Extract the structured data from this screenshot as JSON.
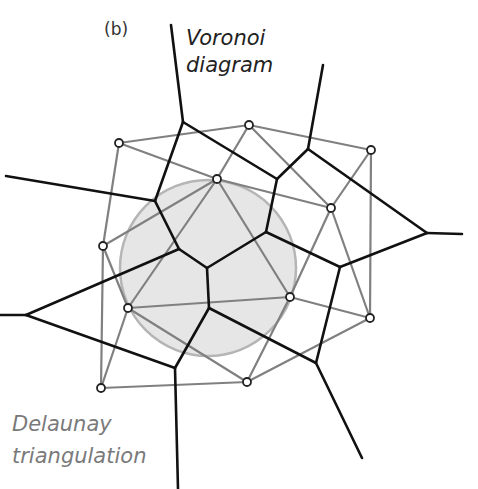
{
  "labels": {
    "panel": "(b)",
    "voronoi_line1": "Voronoi",
    "voronoi_line2": "diagram",
    "delaunay_line1": "Delaunay",
    "delaunay_line2": "triangulation"
  },
  "colors": {
    "voronoi_edge": "#111111",
    "delaunay_edge": "#808080",
    "circle_fill": "#e6e6e6",
    "circle_stroke": "#b5b5b5",
    "point_fill": "#ffffff",
    "point_stroke": "#222222"
  },
  "circumcircle": {
    "cx": 208,
    "cy": 268,
    "r": 88
  },
  "points": [
    [
      119,
      143
    ],
    [
      249,
      125
    ],
    [
      371,
      150
    ],
    [
      217,
      179
    ],
    [
      331,
      208
    ],
    [
      103,
      246
    ],
    [
      128,
      308
    ],
    [
      290,
      297
    ],
    [
      370,
      318
    ],
    [
      101,
      388
    ],
    [
      247,
      382
    ]
  ],
  "delaunay_edges": [
    [
      0,
      1
    ],
    [
      1,
      2
    ],
    [
      0,
      5
    ],
    [
      0,
      3
    ],
    [
      1,
      3
    ],
    [
      1,
      4
    ],
    [
      2,
      4
    ],
    [
      2,
      8
    ],
    [
      3,
      5
    ],
    [
      3,
      6
    ],
    [
      3,
      7
    ],
    [
      3,
      4
    ],
    [
      5,
      6
    ],
    [
      5,
      9
    ],
    [
      6,
      7
    ],
    [
      6,
      9
    ],
    [
      6,
      10
    ],
    [
      7,
      4
    ],
    [
      7,
      8
    ],
    [
      7,
      10
    ],
    [
      4,
      8
    ],
    [
      9,
      10
    ],
    [
      10,
      8
    ]
  ],
  "voronoi_edges": [
    [
      [
        171,
        25
      ],
      [
        183,
        122
      ]
    ],
    [
      [
        183,
        122
      ],
      [
        155,
        201
      ]
    ],
    [
      [
        183,
        122
      ],
      [
        277,
        179
      ]
    ],
    [
      [
        308,
        149
      ],
      [
        323,
        65
      ]
    ],
    [
      [
        308,
        149
      ],
      [
        277,
        179
      ]
    ],
    [
      [
        308,
        149
      ],
      [
        427,
        233
      ]
    ],
    [
      [
        427,
        233
      ],
      [
        462,
        234
      ]
    ],
    [
      [
        427,
        233
      ],
      [
        340,
        267
      ]
    ],
    [
      [
        277,
        179
      ],
      [
        266,
        232
      ]
    ],
    [
      [
        266,
        232
      ],
      [
        207,
        268
      ]
    ],
    [
      [
        266,
        232
      ],
      [
        340,
        267
      ]
    ],
    [
      [
        340,
        267
      ],
      [
        316,
        363
      ]
    ],
    [
      [
        155,
        201
      ],
      [
        6,
        176
      ]
    ],
    [
      [
        155,
        201
      ],
      [
        179,
        249
      ]
    ],
    [
      [
        179,
        249
      ],
      [
        207,
        268
      ]
    ],
    [
      [
        179,
        249
      ],
      [
        26,
        315
      ]
    ],
    [
      [
        26,
        315
      ],
      [
        0,
        315
      ]
    ],
    [
      [
        26,
        315
      ],
      [
        175,
        368
      ]
    ],
    [
      [
        207,
        268
      ],
      [
        209,
        308
      ]
    ],
    [
      [
        209,
        308
      ],
      [
        175,
        368
      ]
    ],
    [
      [
        209,
        308
      ],
      [
        316,
        363
      ]
    ],
    [
      [
        175,
        368
      ],
      [
        178,
        489
      ]
    ],
    [
      [
        316,
        363
      ],
      [
        362,
        458
      ]
    ]
  ]
}
